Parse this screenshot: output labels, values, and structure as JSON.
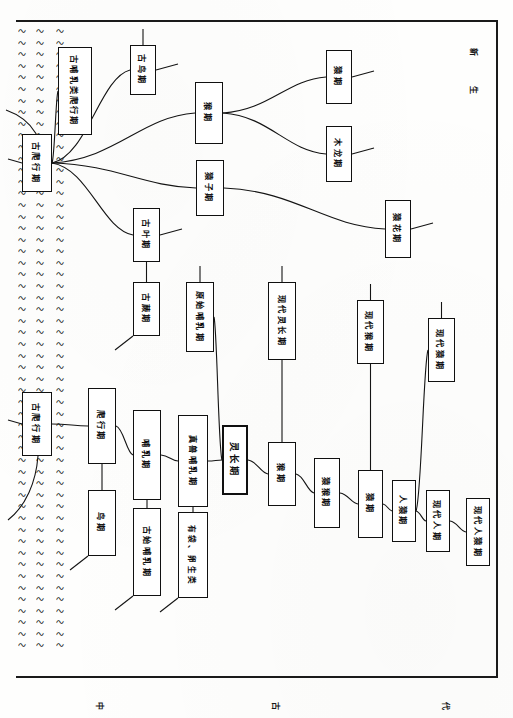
{
  "page": {
    "orientation": "rotated-90",
    "paper_color": "#fdfdfc",
    "ink_color": "#101010",
    "hatch_glyph": "〜",
    "hatch_rows": 54
  },
  "margin_marks": {
    "top_right_upper": "新",
    "top_right_lower": "生",
    "bottom_left": "中",
    "bottom_mid": "古",
    "bottom_right": "代"
  },
  "chart_data": {
    "type": "diagram",
    "subtitle": "爬行期—哺乳期—灵长期—人猿期",
    "nodes": [
      {
        "id": "n1",
        "label": "古爬行期",
        "x": 22,
        "y": 134,
        "w": 30,
        "h": 58,
        "style": "wide"
      },
      {
        "id": "n2",
        "label": "古哺乳类爬行期",
        "x": 58,
        "y": 47,
        "w": 34,
        "h": 88,
        "style": "two-col"
      },
      {
        "id": "n3",
        "label": "古鸟期",
        "x": 130,
        "y": 45,
        "w": 26,
        "h": 50,
        "style": "plain"
      },
      {
        "id": "n4",
        "label": "猴期",
        "x": 195,
        "y": 82,
        "w": 28,
        "h": 62,
        "style": "plain"
      },
      {
        "id": "n5",
        "label": "猿期",
        "x": 326,
        "y": 50,
        "w": 26,
        "h": 54,
        "style": "plain"
      },
      {
        "id": "n6",
        "label": "木龙期",
        "x": 326,
        "y": 126,
        "w": 26,
        "h": 56,
        "style": "plain"
      },
      {
        "id": "n7",
        "label": "猿子期",
        "x": 196,
        "y": 160,
        "w": 28,
        "h": 56,
        "style": "plain"
      },
      {
        "id": "n8",
        "label": "猿花期",
        "x": 385,
        "y": 200,
        "w": 26,
        "h": 58,
        "style": "plain"
      },
      {
        "id": "n9",
        "label": "古叶期",
        "x": 133,
        "y": 208,
        "w": 27,
        "h": 54,
        "style": "plain"
      },
      {
        "id": "n10",
        "label": "古蕨期",
        "x": 133,
        "y": 282,
        "w": 27,
        "h": 54,
        "style": "plain"
      },
      {
        "id": "n11",
        "label": "原始哺乳期",
        "x": 186,
        "y": 282,
        "w": 28,
        "h": 70,
        "style": "plain"
      },
      {
        "id": "n12",
        "label": "现代灵长期",
        "x": 268,
        "y": 282,
        "w": 28,
        "h": 78,
        "style": "plain"
      },
      {
        "id": "n13",
        "label": "现代猴期",
        "x": 357,
        "y": 300,
        "w": 27,
        "h": 64,
        "style": "plain"
      },
      {
        "id": "n14",
        "label": "现代猿期",
        "x": 428,
        "y": 318,
        "w": 27,
        "h": 64,
        "style": "plain"
      },
      {
        "id": "n15",
        "label": "古爬行期",
        "x": 22,
        "y": 392,
        "w": 30,
        "h": 64,
        "style": "wide"
      },
      {
        "id": "n16",
        "label": "爬行期",
        "x": 88,
        "y": 388,
        "w": 28,
        "h": 76,
        "style": "plain"
      },
      {
        "id": "n17",
        "label": "鸟期",
        "x": 88,
        "y": 490,
        "w": 28,
        "h": 66,
        "style": "plain"
      },
      {
        "id": "n18",
        "label": "哺乳期",
        "x": 133,
        "y": 410,
        "w": 28,
        "h": 90,
        "style": "plain"
      },
      {
        "id": "n19",
        "label": "古始哺乳期",
        "x": 133,
        "y": 508,
        "w": 28,
        "h": 88,
        "style": "plain"
      },
      {
        "id": "n20",
        "label": "真兽哺乳期",
        "x": 178,
        "y": 415,
        "w": 30,
        "h": 92,
        "style": "plain"
      },
      {
        "id": "n21",
        "label": "有袋、卵生类",
        "x": 178,
        "y": 512,
        "w": 30,
        "h": 86,
        "style": "small"
      },
      {
        "id": "n22",
        "label": "灵长期",
        "x": 222,
        "y": 425,
        "w": 26,
        "h": 70,
        "style": "bold-box"
      },
      {
        "id": "n23",
        "label": "猴期",
        "x": 268,
        "y": 442,
        "w": 28,
        "h": 64,
        "style": "plain"
      },
      {
        "id": "n24",
        "label": "猿猴期",
        "x": 314,
        "y": 458,
        "w": 26,
        "h": 70,
        "style": "plain"
      },
      {
        "id": "n25",
        "label": "猿期",
        "x": 358,
        "y": 470,
        "w": 25,
        "h": 68,
        "style": "plain"
      },
      {
        "id": "n26",
        "label": "人猿期",
        "x": 392,
        "y": 480,
        "w": 24,
        "h": 62,
        "style": "plain"
      },
      {
        "id": "n27",
        "label": "现代人期",
        "x": 426,
        "y": 490,
        "w": 24,
        "h": 62,
        "style": "plain"
      },
      {
        "id": "n28",
        "label": "现代人猿期",
        "x": 466,
        "y": 498,
        "w": 24,
        "h": 68,
        "style": "plain"
      }
    ],
    "edges": [
      {
        "from": "n1",
        "to": "n2"
      },
      {
        "from": "n1",
        "to": "n3"
      },
      {
        "from": "n1",
        "to": "n4"
      },
      {
        "from": "n1",
        "to": "n7"
      },
      {
        "from": "n1",
        "to": "n9"
      },
      {
        "from": "n4",
        "to": "n5"
      },
      {
        "from": "n4",
        "to": "n6"
      },
      {
        "from": "n7",
        "to": "n8"
      },
      {
        "from": "n9",
        "to": "n10"
      },
      {
        "from": "n15",
        "to": "n16"
      },
      {
        "from": "n16",
        "to": "n17"
      },
      {
        "from": "n16",
        "to": "n18"
      },
      {
        "from": "n18",
        "to": "n19"
      },
      {
        "from": "n18",
        "to": "n20"
      },
      {
        "from": "n20",
        "to": "n21"
      },
      {
        "from": "n20",
        "to": "n22"
      },
      {
        "from": "n22",
        "to": "n11"
      },
      {
        "from": "n22",
        "to": "n23"
      },
      {
        "from": "n23",
        "to": "n12"
      },
      {
        "from": "n23",
        "to": "n24"
      },
      {
        "from": "n24",
        "to": "n25"
      },
      {
        "from": "n25",
        "to": "n13"
      },
      {
        "from": "n25",
        "to": "n26"
      },
      {
        "from": "n26",
        "to": "n14"
      },
      {
        "from": "n26",
        "to": "n27"
      },
      {
        "from": "n27",
        "to": "n28"
      }
    ],
    "axis_note": "左侧波浪网纹表示地层/时代分隔",
    "grid": false,
    "legend": []
  }
}
